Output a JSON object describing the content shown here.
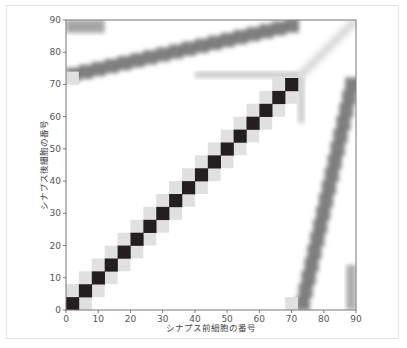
{
  "chart_data": {
    "type": "heatmap",
    "title": "",
    "xlabel": "シナプス前細胞の番号",
    "ylabel": "シナプス後細胞の番号",
    "xlim": [
      0,
      90
    ],
    "ylim": [
      0,
      90
    ],
    "xticks": [
      0,
      10,
      20,
      30,
      40,
      50,
      60,
      70,
      80,
      90
    ],
    "yticks": [
      0,
      10,
      20,
      30,
      40,
      50,
      60,
      70,
      80,
      90
    ],
    "colormap": "grayscale (white=0, black=max)",
    "grid": false,
    "block_size": 4,
    "regions": [
      {
        "name": "diagonal self-connections",
        "description": "Dark diagonal blocks from (0,0) to (72,72), 18 blocks of size 4, each flanked by light gray neighbors"
      },
      {
        "name": "upper band",
        "description": "Gray band for presynaptic 0-72 mapping to postsynaptic ~72-90, rising from y≈73 at x=0 to y≈89 at x=72"
      },
      {
        "name": "right band",
        "description": "Gray band for postsynaptic 0-72 mapping from presynaptic ~73-90, leaning from x≈73 at y=0 to x≈89 at y=72"
      },
      {
        "name": "upper-right faint diagonal",
        "description": "Faint blurred diagonal from (72,72) to (90,90)"
      }
    ]
  },
  "figure": {
    "colors": {
      "diagonal": "#231f20",
      "neighbor": "#e0e0e0",
      "band": "#6a6a6a",
      "axis": "#777777",
      "frame": "#e4e4e4"
    }
  }
}
